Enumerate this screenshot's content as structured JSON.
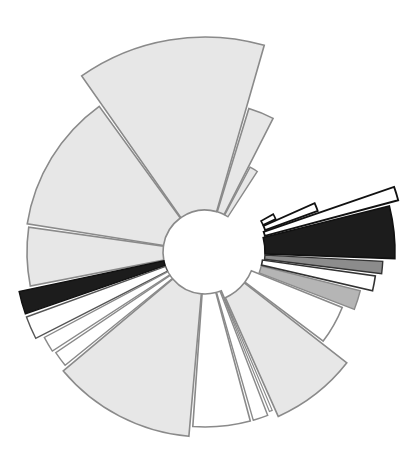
{
  "figure": {
    "kind": "radial-wedge-diagram",
    "background_color": "#ffffff",
    "width": 410,
    "height": 471
  },
  "chart_data": {
    "type": "pie",
    "title": "",
    "subtitle": "",
    "xlabel": "",
    "ylabel": "",
    "legend_position": "none",
    "grid": false,
    "center_x": 205,
    "center_y": 252,
    "inner_radius": 42,
    "max_radius": 215,
    "angle_units": "degrees",
    "angle_zero_direction": "east",
    "angle_direction": "clockwise",
    "radius_axis_label": "",
    "angle_axis_label": "",
    "note": "Nightingale rose / variable-radius sector diagram. Each wedge has a start angle, end angle, outer radius and grayscale fill. A large angular gap spans the upper-right quadrant.",
    "palette": {
      "light_gray": "#e7e7e7",
      "white": "#ffffff",
      "mid_gray": "#b5b5b5",
      "dark_gray": "#8c8c8c",
      "near_black": "#1c1c1c",
      "outline_gray": "#8a8a8a",
      "outline_black": "#111111"
    },
    "categories": [
      "S01",
      "S02",
      "S03",
      "S04",
      "S05",
      "S06",
      "S07",
      "S08",
      "S09",
      "S10",
      "S11",
      "S12",
      "S13",
      "S14",
      "S15",
      "S16",
      "S17",
      "S18",
      "S19",
      "S20",
      "S21",
      "S22"
    ],
    "values": [
      215,
      180,
      170,
      130,
      88,
      85,
      82,
      86,
      200,
      168,
      120,
      118,
      160,
      155,
      120,
      215,
      213,
      212,
      210,
      208,
      206,
      205
    ],
    "wedges": [
      {
        "label": "S01",
        "start_angle": -125,
        "end_angle": -74,
        "outer_radius": 215,
        "inner_radius": 42,
        "fill": "#e7e7e7",
        "stroke": "#8a8a8a",
        "stroke_width": 1.6
      },
      {
        "label": "S02",
        "start_angle": -73,
        "end_angle": -63,
        "outer_radius": 150,
        "inner_radius": 42,
        "fill": "#e7e7e7",
        "stroke": "#8a8a8a",
        "stroke_width": 1.6
      },
      {
        "label": "S03",
        "start_angle": -62,
        "end_angle": -57,
        "outer_radius": 96,
        "inner_radius": 42,
        "fill": "#e7e7e7",
        "stroke": "#8a8a8a",
        "stroke_width": 1.4
      },
      {
        "label": "S04",
        "start_angle": -171,
        "end_angle": -126,
        "outer_radius": 180,
        "inner_radius": 42,
        "fill": "#e7e7e7",
        "stroke": "#8a8a8a",
        "stroke_width": 1.6
      },
      {
        "label": "S05",
        "start_angle": -191,
        "end_angle": -172,
        "outer_radius": 178,
        "inner_radius": 42,
        "fill": "#e7e7e7",
        "stroke": "#8a8a8a",
        "stroke_width": 1.6
      },
      {
        "label": "S06",
        "start_angle": -199,
        "end_angle": -192,
        "outer_radius": 190,
        "inner_radius": 42,
        "fill": "#1c1c1c",
        "stroke": "#111111",
        "stroke_width": 1.4
      },
      {
        "label": "S07",
        "start_angle": -207,
        "end_angle": -200,
        "outer_radius": 190,
        "inner_radius": 42,
        "fill": "#ffffff",
        "stroke": "#555555",
        "stroke_width": 1.4
      },
      {
        "label": "S08",
        "start_angle": -213,
        "end_angle": -208,
        "outer_radius": 182,
        "inner_radius": 42,
        "fill": "#ffffff",
        "stroke": "#8a8a8a",
        "stroke_width": 1.4
      },
      {
        "label": "S09",
        "start_angle": -219,
        "end_angle": -214,
        "outer_radius": 180,
        "inner_radius": 42,
        "fill": "#ffffff",
        "stroke": "#8a8a8a",
        "stroke_width": 1.4
      },
      {
        "label": "S10",
        "start_angle": -265,
        "end_angle": -220,
        "outer_radius": 185,
        "inner_radius": 42,
        "fill": "#e7e7e7",
        "stroke": "#8a8a8a",
        "stroke_width": 1.6
      },
      {
        "label": "S11",
        "start_angle": -285,
        "end_angle": -266,
        "outer_radius": 175,
        "inner_radius": 42,
        "fill": "#ffffff",
        "stroke": "#8a8a8a",
        "stroke_width": 1.6
      },
      {
        "label": "S12",
        "start_angle": -291,
        "end_angle": -286,
        "outer_radius": 175,
        "inner_radius": 42,
        "fill": "#ffffff",
        "stroke": "#8a8a8a",
        "stroke_width": 1.4
      },
      {
        "label": "S13",
        "start_angle": -293,
        "end_angle": -292,
        "outer_radius": 172,
        "inner_radius": 42,
        "fill": "#ffffff",
        "stroke": "#8a8a8a",
        "stroke_width": 1.2
      },
      {
        "label": "S14",
        "start_angle": -322,
        "end_angle": -294,
        "outer_radius": 180,
        "inner_radius": 50,
        "fill": "#e7e7e7",
        "stroke": "#8a8a8a",
        "stroke_width": 1.6
      },
      {
        "label": "S15",
        "start_angle": -338,
        "end_angle": -323,
        "outer_radius": 148,
        "inner_radius": 50,
        "fill": "#ffffff",
        "stroke": "#8a8a8a",
        "stroke_width": 1.6
      },
      {
        "label": "S16",
        "start_angle": -346,
        "end_angle": -339,
        "outer_radius": 160,
        "inner_radius": 58,
        "fill": "#b5b5b5",
        "stroke": "#8a8a8a",
        "stroke_width": 1.4
      },
      {
        "label": "S17",
        "start_angle": -352,
        "end_angle": -347,
        "outer_radius": 172,
        "inner_radius": 58,
        "fill": "#ffffff",
        "stroke": "#333333",
        "stroke_width": 1.6
      },
      {
        "label": "S18",
        "start_angle": -357,
        "end_angle": -353,
        "outer_radius": 178,
        "inner_radius": 60,
        "fill": "#8c8c8c",
        "stroke": "#333333",
        "stroke_width": 1.4
      },
      {
        "label": "S19",
        "start_angle": -374,
        "end_angle": -358,
        "outer_radius": 190,
        "inner_radius": 60,
        "fill": "#1c1c1c",
        "stroke": "#111111",
        "stroke_width": 1.6
      },
      {
        "label": "S20",
        "start_angle": -379,
        "end_angle": -375,
        "outer_radius": 200,
        "inner_radius": 62,
        "fill": "#ffffff",
        "stroke": "#111111",
        "stroke_width": 1.8
      },
      {
        "label": "S21",
        "start_angle": -384,
        "end_angle": -380,
        "outer_radius": 120,
        "inner_radius": 64,
        "fill": "#ffffff",
        "stroke": "#111111",
        "stroke_width": 1.8
      },
      {
        "label": "S22",
        "start_angle": -389,
        "end_angle": -385,
        "outer_radius": 78,
        "inner_radius": 64,
        "fill": "#ffffff",
        "stroke": "#111111",
        "stroke_width": 1.6
      }
    ],
    "gap": {
      "description": "empty angular range (no wedges drawn)",
      "start_angle": -57,
      "end_angle": 0
    }
  }
}
